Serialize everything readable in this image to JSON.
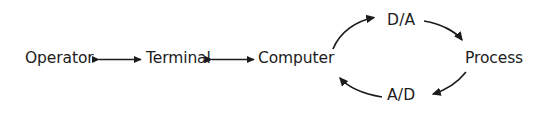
{
  "diagram": {
    "type": "block-flow-loop",
    "background_color": "#ffffff",
    "stroke_color": "#1c1c1c",
    "nodes": [
      {
        "id": "operator",
        "label": "Operator"
      },
      {
        "id": "terminal",
        "label": "Terminal"
      },
      {
        "id": "computer",
        "label": "Computer"
      },
      {
        "id": "process",
        "label": "Process"
      }
    ],
    "converters": [
      {
        "id": "da",
        "label": "D/A"
      },
      {
        "id": "ad",
        "label": "A/D"
      }
    ],
    "connections": [
      {
        "from": "operator",
        "to": "terminal",
        "style": "double-arrow-straight"
      },
      {
        "from": "terminal",
        "to": "computer",
        "style": "double-arrow-straight"
      },
      {
        "from": "computer",
        "to": "da",
        "style": "single-arrow-curve"
      },
      {
        "from": "da",
        "to": "process",
        "style": "single-arrow-curve"
      },
      {
        "from": "process",
        "to": "ad",
        "style": "single-arrow-curve"
      },
      {
        "from": "ad",
        "to": "computer",
        "style": "single-arrow-curve"
      }
    ]
  }
}
